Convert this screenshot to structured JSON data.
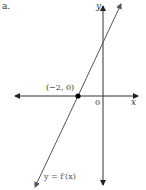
{
  "figure": {
    "part_label": "a.",
    "x_axis_label": "x",
    "y_axis_label": "y",
    "origin_label": "0",
    "point_label": "(−2, 0)",
    "function_label": "y = f′(x)"
  },
  "colors": {
    "axis": "#333333",
    "line": "#555555",
    "point": "#000000"
  }
}
